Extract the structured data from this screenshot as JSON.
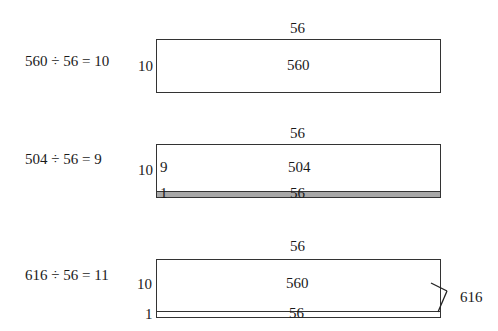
{
  "diagrams": [
    {
      "equation": "560 ÷ 56 = 10",
      "top_label": "56",
      "side_label": "10",
      "center_label": "560"
    },
    {
      "equation": "504 ÷ 56 = 9",
      "top_label": "56",
      "side_label": "10",
      "inner_side_label": "9",
      "center_label": "504",
      "strip_side_label": "1",
      "strip_label": "56",
      "strip_color": "#a8a8a8"
    },
    {
      "equation": "616 ÷ 56 = 11",
      "top_label": "56",
      "side_label": "10",
      "center_label": "560",
      "strip_side_label": "1",
      "strip_label": "56",
      "brace_label": "616"
    }
  ]
}
